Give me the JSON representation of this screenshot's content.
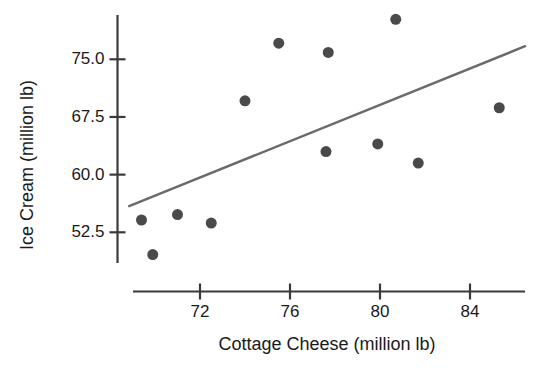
{
  "chart_data": {
    "type": "scatter",
    "title": "",
    "xlabel": "Cottage Cheese (million lb)",
    "ylabel": "Ice Cream (million lb)",
    "xlim": [
      68.5,
      86.5
    ],
    "ylim": [
      48.0,
      81.5
    ],
    "grid": false,
    "legend": null,
    "xticks": [
      72,
      76,
      80,
      84
    ],
    "xtick_labels": [
      "72",
      "76",
      "80",
      "84"
    ],
    "yticks": [
      52.5,
      60.0,
      67.5,
      75.0
    ],
    "ytick_labels": [
      "52.5",
      "60.0",
      "67.5",
      "75.0"
    ],
    "marker_color": "#4a4a4a",
    "marker_size": 11,
    "points": [
      {
        "x": 69.4,
        "y": 54.1
      },
      {
        "x": 69.9,
        "y": 49.6
      },
      {
        "x": 71.0,
        "y": 54.8
      },
      {
        "x": 72.5,
        "y": 53.7
      },
      {
        "x": 74.0,
        "y": 69.6
      },
      {
        "x": 75.5,
        "y": 77.1
      },
      {
        "x": 77.6,
        "y": 63.0
      },
      {
        "x": 77.7,
        "y": 75.9
      },
      {
        "x": 79.9,
        "y": 64.0
      },
      {
        "x": 80.7,
        "y": 80.2
      },
      {
        "x": 81.7,
        "y": 61.5
      },
      {
        "x": 85.3,
        "y": 68.7
      }
    ],
    "series": [
      {
        "name": "Ice Cream vs Cottage Cheese",
        "type": "scatter",
        "values": [
          54.1,
          49.6,
          54.8,
          53.7,
          69.6,
          77.1,
          63.0,
          75.9,
          64.0,
          80.2,
          61.5,
          68.7
        ],
        "x": [
          69.4,
          69.9,
          71.0,
          72.5,
          74.0,
          75.5,
          77.6,
          77.7,
          79.9,
          80.7,
          81.7,
          85.3
        ]
      },
      {
        "name": "regression line",
        "type": "line",
        "color": "#6a6a6a",
        "x": [
          68.85,
          86.45
        ],
        "values": [
          55.9,
          76.7
        ]
      }
    ],
    "fit_line": {
      "x_start": 68.85,
      "y_start": 55.9,
      "x_end": 86.45,
      "y_end": 76.7,
      "color": "#6a6a6a",
      "width": 2.4
    },
    "axis_color": "#3a3a3a"
  }
}
